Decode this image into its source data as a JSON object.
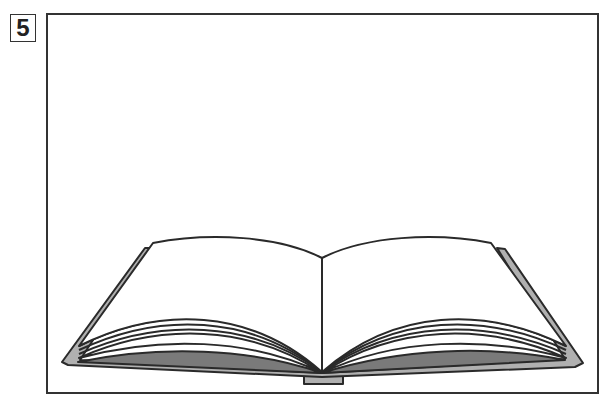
{
  "panel": {
    "number": "5",
    "subject": "open-book"
  },
  "colors": {
    "outline": "#2a2a2a",
    "cover": "#b0b0b0",
    "page_shadow": "#7a7a7a",
    "page": "#ffffff"
  }
}
